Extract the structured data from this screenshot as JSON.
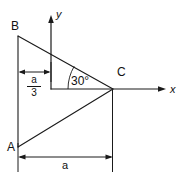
{
  "figure": {
    "kind": "geometry-diagram",
    "stroke_color": "#1a1a1a",
    "background_color": "#ffffff",
    "vertices": [
      {
        "name": "A",
        "label": "A",
        "x": 18,
        "y": 147
      },
      {
        "name": "B",
        "label": "B",
        "x": 18,
        "y": 36
      },
      {
        "name": "C",
        "label": "C",
        "x": 113,
        "y": 89
      }
    ],
    "axes": {
      "x_label": "x",
      "y_label": "y",
      "origin": {
        "x": 51,
        "y": 89
      },
      "x_tip": {
        "x": 166,
        "y": 89
      },
      "y_tip": {
        "x": 51,
        "y": 15
      }
    },
    "angle": {
      "label": "30",
      "degree_symbol": "°",
      "value_text": "30°",
      "at_vertex": "C",
      "arc_radius": 45
    },
    "dimensions": [
      {
        "name": "a-over-3",
        "numerator": "a",
        "denominator": "3",
        "from_x": 18,
        "to_x": 51,
        "y": 72,
        "orientation": "horizontal"
      },
      {
        "name": "a",
        "label": "a",
        "from_x": 18,
        "to_x": 113,
        "y": 157,
        "orientation": "horizontal"
      }
    ]
  }
}
